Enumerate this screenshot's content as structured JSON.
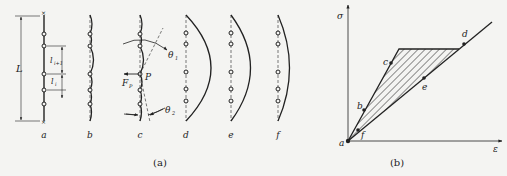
{
  "figure": {
    "panel_a": {
      "caption": "(a)",
      "columns": [
        {
          "label": "a",
          "shape": "straight"
        },
        {
          "label": "b",
          "shape": "wavy-local"
        },
        {
          "label": "c",
          "shape": "wavy-local-with-rotation"
        },
        {
          "label": "d",
          "shape": "global-bow-large"
        },
        {
          "label": "e",
          "shape": "global-bow-medium"
        },
        {
          "label": "f",
          "shape": "global-bow-small"
        }
      ],
      "dimension_labels": {
        "total_length": "L",
        "segment_upper": "l",
        "segment_upper_subscript": "i+1",
        "segment_lower": "l",
        "segment_lower_subscript": "i"
      },
      "force_label": "F",
      "force_subscript": "P",
      "point_label": "P",
      "angle_labels": [
        {
          "symbol": "θ",
          "subscript": "1"
        },
        {
          "symbol": "θ",
          "subscript": "2"
        }
      ]
    },
    "panel_b": {
      "caption": "(b)",
      "y_axis_label": "σ",
      "x_axis_label": "ε",
      "points": [
        {
          "label": "a"
        },
        {
          "label": "b"
        },
        {
          "label": "c"
        },
        {
          "label": "d"
        },
        {
          "label": "e"
        },
        {
          "label": "f"
        }
      ],
      "hatched_region": "triangle between loading path a-b-c-plateau and linear path a-f-e-d"
    }
  }
}
